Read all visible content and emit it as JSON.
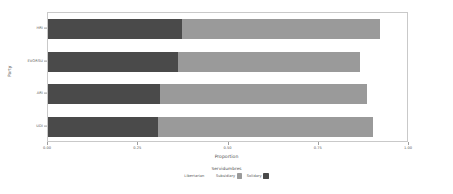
{
  "chart_data": {
    "type": "bar",
    "orientation": "horizontal",
    "stacked": true,
    "normalized": true,
    "title": "",
    "xlabel": "Proportion",
    "ylabel": "Party",
    "xlim": [
      0,
      1
    ],
    "xticks": [
      0,
      0.25,
      0.5,
      0.75,
      1
    ],
    "xticklabels": [
      "0.00",
      "0.25",
      "0.50",
      "0.75",
      "1.00"
    ],
    "grid": false,
    "legend_title": "Servidumbres",
    "legend_position": "bottom",
    "categories": [
      "HRI",
      "EVORSU",
      "ARI",
      "UDI"
    ],
    "series": [
      {
        "name": "Libertarian",
        "color": "#ffffff",
        "values": [
          0.08,
          0.135,
          0.115,
          0.1
        ]
      },
      {
        "name": "Subsidiary",
        "color": "#9a9a9a",
        "values": [
          0.55,
          0.505,
          0.575,
          0.595
        ]
      },
      {
        "name": "Solidary",
        "color": "#4a4a4a",
        "values": [
          0.37,
          0.36,
          0.31,
          0.305
        ]
      }
    ],
    "stack_order": [
      "Solidary",
      "Subsidiary",
      "Libertarian"
    ],
    "segments": [
      {
        "category": "HRI",
        "solidary_end": 0.37,
        "subsidiary_end": 0.92
      },
      {
        "category": "EVORSU",
        "solidary_end": 0.36,
        "subsidiary_end": 0.865
      },
      {
        "category": "ARI",
        "solidary_end": 0.31,
        "subsidiary_end": 0.885
      },
      {
        "category": "UDI",
        "solidary_end": 0.305,
        "subsidiary_end": 0.9
      }
    ]
  },
  "legend": {
    "title": "Servidumbres",
    "entries": [
      {
        "label": "Libertarian",
        "color": "#ffffff"
      },
      {
        "label": "Subsidiary",
        "color": "#9a9a9a"
      },
      {
        "label": "Solidary",
        "color": "#4a4a4a"
      }
    ]
  },
  "axes": {
    "x_title": "Proportion",
    "y_title": "Party"
  }
}
